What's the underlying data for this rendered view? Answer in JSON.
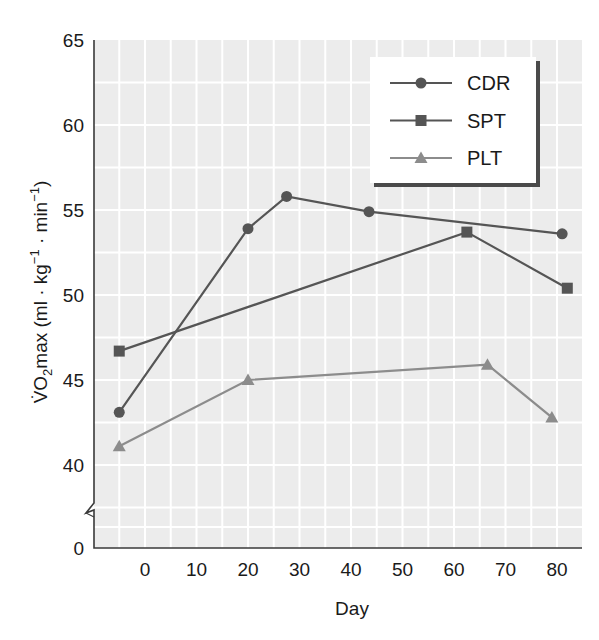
{
  "chart_data": {
    "type": "line",
    "title": "",
    "xlabel": "Day",
    "ylabel": "V̇O2max (ml · kg−1 · min−1)",
    "ylabel_parts": {
      "prefix": "V̇O",
      "sub": "2",
      "main": "max (ml · kg",
      "sup1": "−1",
      "mid": " · min",
      "sup2": "−1",
      "end": ")"
    },
    "x_ticks": [
      0,
      10,
      20,
      30,
      40,
      50,
      60,
      70,
      80
    ],
    "y_ticks": [
      0,
      40,
      45,
      50,
      55,
      60,
      65
    ],
    "y_axis_break": {
      "between": [
        0,
        40
      ]
    },
    "xlim": [
      -10,
      85
    ],
    "ylim": [
      37.5,
      65
    ],
    "grid": true,
    "grid_minor_x_step": 5,
    "grid_minor_y_step": 2.5,
    "legend_position": "upper right",
    "series": [
      {
        "name": "CDR",
        "marker": "circle",
        "color": "#555555",
        "points": [
          {
            "x": -5,
            "y": 43.1
          },
          {
            "x": 20,
            "y": 53.9
          },
          {
            "x": 27.5,
            "y": 55.8
          },
          {
            "x": 43.5,
            "y": 54.9
          },
          {
            "x": 81,
            "y": 53.6
          }
        ]
      },
      {
        "name": "SPT",
        "marker": "square",
        "color": "#555555",
        "points": [
          {
            "x": -5,
            "y": 46.7
          },
          {
            "x": 62.5,
            "y": 53.7
          },
          {
            "x": 82,
            "y": 50.4
          }
        ]
      },
      {
        "name": "PLT",
        "marker": "triangle",
        "color": "#8c8c8c",
        "points": [
          {
            "x": -5,
            "y": 41.1
          },
          {
            "x": 20,
            "y": 45.0
          },
          {
            "x": 66.5,
            "y": 45.9
          },
          {
            "x": 79,
            "y": 42.8
          }
        ]
      }
    ]
  },
  "colors": {
    "plot_background": "#ececec",
    "gridline": "#ffffff",
    "axis": "#3a3a3a",
    "legend_shadow": "#4a4a4a"
  }
}
